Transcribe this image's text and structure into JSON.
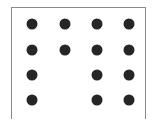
{
  "figure": {
    "type": "dot-grid",
    "rows": 4,
    "columns": 4,
    "dot_color": "#262626",
    "border_color": "#8a8a8a",
    "column_x": [
      32,
      65,
      97,
      129
    ],
    "row_y": [
      24,
      50,
      75,
      100
    ],
    "pattern": [
      [
        1,
        1,
        1,
        1
      ],
      [
        1,
        1,
        1,
        1
      ],
      [
        1,
        0,
        1,
        1
      ],
      [
        1,
        0,
        1,
        1
      ]
    ]
  }
}
